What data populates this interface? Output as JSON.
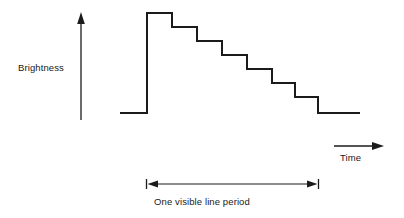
{
  "figure": {
    "background_color": "#ffffff",
    "ink_color": "#1b1b1b",
    "width": 404,
    "height": 218
  },
  "axes": {
    "y": {
      "label": "Brightness",
      "icon": "up-arrow-icon",
      "x": 81,
      "y_bottom": 120,
      "y_top": 14
    },
    "x": {
      "label": "Time",
      "icon": "right-arrow-icon",
      "y": 146,
      "x_start": 334,
      "x_end": 383
    }
  },
  "annotation": {
    "caption": "One visible line period",
    "dimension_line": {
      "y": 184,
      "x_start": 146,
      "x_end": 319,
      "left_cap": "left-arrow-icon",
      "right_cap": "right-arrow-icon",
      "tick_half_height": 5
    }
  },
  "chart_data": {
    "type": "line",
    "xlabel": "Time",
    "ylabel": "Brightness",
    "grid": false,
    "legend": null,
    "axis_style": "arrow-only, unlabeled ticks",
    "xlim": [
      110,
      400
    ],
    "ylim": [
      0,
      8
    ],
    "levels": {
      "units": "relative brightness steps",
      "blanking": 0,
      "peak": 7,
      "step_decrement": 1
    },
    "points_px": [
      [
        120,
        113
      ],
      [
        147,
        113
      ],
      [
        147,
        13
      ],
      [
        172,
        13
      ],
      [
        172,
        27
      ],
      [
        197,
        27
      ],
      [
        197,
        41
      ],
      [
        222,
        41
      ],
      [
        222,
        55
      ],
      [
        247,
        55
      ],
      [
        247,
        69
      ],
      [
        272,
        69
      ],
      [
        272,
        83
      ],
      [
        295,
        83
      ],
      [
        295,
        97
      ],
      [
        318,
        97
      ],
      [
        318,
        113
      ],
      [
        360,
        113
      ]
    ],
    "steps": [
      {
        "index": 0,
        "name": "blanking-lead-in",
        "level": 0,
        "x_start": 120,
        "x_end": 147
      },
      {
        "index": 1,
        "name": "peak-plateau",
        "level": 7,
        "x_start": 147,
        "x_end": 172
      },
      {
        "index": 2,
        "name": "step-6",
        "level": 6,
        "x_start": 172,
        "x_end": 197
      },
      {
        "index": 3,
        "name": "step-5",
        "level": 5,
        "x_start": 197,
        "x_end": 222
      },
      {
        "index": 4,
        "name": "step-4",
        "level": 4,
        "x_start": 222,
        "x_end": 247
      },
      {
        "index": 5,
        "name": "step-3",
        "level": 3,
        "x_start": 247,
        "x_end": 272
      },
      {
        "index": 6,
        "name": "step-2",
        "level": 2,
        "x_start": 272,
        "x_end": 295
      },
      {
        "index": 7,
        "name": "step-1",
        "level": 1,
        "x_start": 295,
        "x_end": 318
      },
      {
        "index": 8,
        "name": "blanking-trail-out",
        "level": 0,
        "x_start": 318,
        "x_end": 360
      }
    ]
  }
}
